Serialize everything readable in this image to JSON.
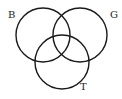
{
  "diagram": {
    "type": "venn",
    "sets": [
      {
        "label": "B",
        "cx": 43,
        "cy": 35,
        "r": 27,
        "label_x": 8,
        "label_y": 18
      },
      {
        "label": "G",
        "cx": 80,
        "cy": 35,
        "r": 27,
        "label_x": 110,
        "label_y": 18
      },
      {
        "label": "T",
        "cx": 62,
        "cy": 62,
        "r": 27,
        "label_x": 80,
        "label_y": 90
      }
    ],
    "stroke_color": "#1a1a1a",
    "background": "#ffffff"
  }
}
